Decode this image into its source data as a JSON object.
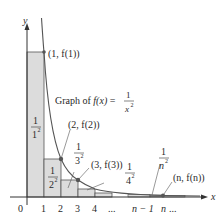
{
  "diagram": {
    "axes": {
      "x_label": "x",
      "y_label": "y",
      "ticks": [
        "0",
        "1",
        "2",
        "3",
        "4",
        "...",
        "n − 1",
        "n",
        "..."
      ]
    },
    "graph_label": {
      "prefix": "Graph of ",
      "func": "f(x)",
      "equals": " = ",
      "numerator": "1",
      "denominator": "x",
      "exponent": "2"
    },
    "points": [
      {
        "label": "(1, f(1))"
      },
      {
        "label": "(2, f(2))"
      },
      {
        "label": "(3, f(3))"
      },
      {
        "label": "(n, f(n))"
      }
    ],
    "rectangle_labels": [
      {
        "num": "1",
        "den": "1",
        "exp": "2"
      },
      {
        "num": "1",
        "den": "2",
        "exp": "2"
      },
      {
        "num": "1",
        "den": "3",
        "exp": "2"
      },
      {
        "num": "1",
        "den": "4",
        "exp": "2"
      },
      {
        "num": "1",
        "den": "n",
        "exp": "2"
      }
    ],
    "colors": {
      "rect_fill": "#dcdcdc",
      "rect_stroke": "#555555",
      "curve": "#555555",
      "axis": "#333333",
      "point": "#555555"
    }
  }
}
